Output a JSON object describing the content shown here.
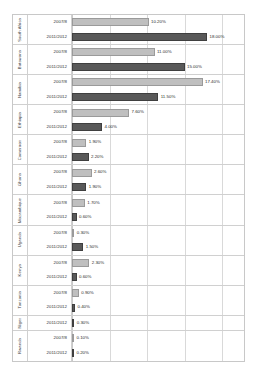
{
  "chart_data": {
    "type": "bar",
    "title": "",
    "xlabel": "",
    "ylabel": "",
    "orientation": "horizontal",
    "grid": true,
    "legend_position": "none",
    "xlim": [
      0,
      20
    ],
    "xticks": [
      0,
      5,
      10,
      15,
      20
    ],
    "categories": [
      "South Africa",
      "Botswana",
      "Namibia",
      "Ethiopia",
      "Cameroon",
      "Ghana",
      "Mozambique",
      "Uganda",
      "Kenya",
      "Tanzania",
      "Niger",
      "Rwanda"
    ],
    "series": [
      {
        "name": "2007/8",
        "color": "#bfbfbf",
        "values": [
          10.2,
          11.0,
          17.4,
          7.6,
          1.9,
          2.6,
          1.7,
          0.3,
          2.3,
          0.9,
          null,
          0.1
        ]
      },
      {
        "name": "2011/2012",
        "color": "#595959",
        "values": [
          18.0,
          15.0,
          11.5,
          4.0,
          2.2,
          1.9,
          0.6,
          1.5,
          0.6,
          0.4,
          0.3,
          0.2
        ]
      }
    ],
    "groups": [
      {
        "country": "South Africa",
        "bars": [
          {
            "year": "2007/8",
            "value": 10.2,
            "label": "10.20%",
            "shade": "light"
          },
          {
            "year": "2011/2012",
            "value": 18.0,
            "label": "18.00%",
            "shade": "dark"
          }
        ]
      },
      {
        "country": "Botswana",
        "bars": [
          {
            "year": "2007/8",
            "value": 11.0,
            "label": "11.00%",
            "shade": "light"
          },
          {
            "year": "2011/2012",
            "value": 15.0,
            "label": "15.00%",
            "shade": "dark"
          }
        ]
      },
      {
        "country": "Namibia",
        "bars": [
          {
            "year": "2007/8",
            "value": 17.4,
            "label": "17.40%",
            "shade": "light"
          },
          {
            "year": "2011/2012",
            "value": 11.5,
            "label": "11.50%",
            "shade": "dark"
          }
        ]
      },
      {
        "country": "Ethiopia",
        "bars": [
          {
            "year": "2007/8",
            "value": 7.6,
            "label": "7.60%",
            "shade": "light"
          },
          {
            "year": "2011/2012",
            "value": 4.0,
            "label": "4.00%",
            "shade": "dark"
          }
        ]
      },
      {
        "country": "Cameroon",
        "bars": [
          {
            "year": "2007/8",
            "value": 1.9,
            "label": "1.90%",
            "shade": "light"
          },
          {
            "year": "2011/2012",
            "value": 2.2,
            "label": "2.20%",
            "shade": "dark"
          }
        ]
      },
      {
        "country": "Ghana",
        "bars": [
          {
            "year": "2007/8",
            "value": 2.6,
            "label": "2.60%",
            "shade": "light"
          },
          {
            "year": "2011/2012",
            "value": 1.9,
            "label": "1.90%",
            "shade": "dark"
          }
        ]
      },
      {
        "country": "Mozambique",
        "bars": [
          {
            "year": "2007/8",
            "value": 1.7,
            "label": "1.70%",
            "shade": "light"
          },
          {
            "year": "2011/2012",
            "value": 0.6,
            "label": "0.60%",
            "shade": "dark"
          }
        ]
      },
      {
        "country": "Uganda",
        "bars": [
          {
            "year": "2007/8",
            "value": 0.3,
            "label": "0.30%",
            "shade": "light"
          },
          {
            "year": "2011/2012",
            "value": 1.5,
            "label": "1.50%",
            "shade": "dark"
          }
        ]
      },
      {
        "country": "Kenya",
        "bars": [
          {
            "year": "2007/8",
            "value": 2.3,
            "label": "2.30%",
            "shade": "light"
          },
          {
            "year": "2011/2012",
            "value": 0.6,
            "label": "0.60%",
            "shade": "dark"
          }
        ]
      },
      {
        "country": "Tanzania",
        "bars": [
          {
            "year": "2007/8",
            "value": 0.9,
            "label": "0.90%",
            "shade": "light"
          },
          {
            "year": "2011/2012",
            "value": 0.4,
            "label": "0.40%",
            "shade": "dark"
          }
        ]
      },
      {
        "country": "Niger",
        "bars": [
          {
            "year": "2011/2012",
            "value": 0.3,
            "label": "0.30%",
            "shade": "dark"
          }
        ]
      },
      {
        "country": "Rwanda",
        "bars": [
          {
            "year": "2007/8",
            "value": 0.1,
            "label": "0.10%",
            "shade": "light"
          },
          {
            "year": "2011/2012",
            "value": 0.2,
            "label": "0.20%",
            "shade": "dark"
          }
        ]
      }
    ]
  },
  "colors": {
    "series_2007": "#bfbfbf",
    "series_2011": "#595959",
    "gridline": "#d9d9d9",
    "frame": "#c8c8c8"
  }
}
